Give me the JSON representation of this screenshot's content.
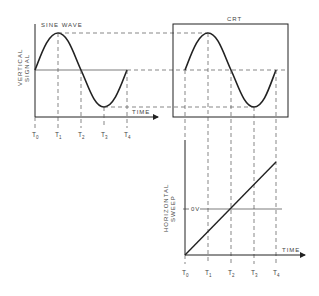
{
  "diagram": {
    "colors": {
      "line": "#222222",
      "dash": "#555555",
      "text": "#444444",
      "background": "#ffffff"
    },
    "sine_panel": {
      "title": "SINE WAVE",
      "y_label_line1": "VERTICAL",
      "y_label_line2": "SIGNAL",
      "x_label": "TIME",
      "ticks": [
        {
          "main": "T",
          "sub": "0"
        },
        {
          "main": "T",
          "sub": "1"
        },
        {
          "main": "T",
          "sub": "2"
        },
        {
          "main": "T",
          "sub": "3"
        },
        {
          "main": "T",
          "sub": "4"
        }
      ]
    },
    "crt_panel": {
      "title": "CRT"
    },
    "sweep_panel": {
      "y_label_line1": "HORIZONTAL",
      "y_label_line2": "SWEEP",
      "zero_label": "0V",
      "x_label": "TIME",
      "ticks": [
        {
          "main": "T",
          "sub": "0"
        },
        {
          "main": "T",
          "sub": "1"
        },
        {
          "main": "T",
          "sub": "2"
        },
        {
          "main": "T",
          "sub": "3"
        },
        {
          "main": "T",
          "sub": "4"
        }
      ]
    }
  }
}
